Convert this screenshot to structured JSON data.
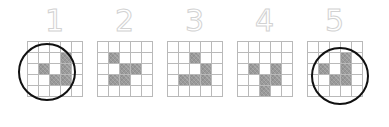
{
  "figure": {
    "type": "pattern-grid-sequence",
    "background_color": "#ffffff",
    "grid_line_color": "#b9b9b9",
    "filled_cell_color": "#9a9a9a",
    "label_outline_color": "#d2d2d2",
    "circle_color": "#111111",
    "grid_rows": 5,
    "grid_cols": 5,
    "panel_count": 5
  },
  "panels": [
    {
      "label": "1",
      "circled": true,
      "filled_cells": [
        [
          2,
          4
        ],
        [
          3,
          2
        ],
        [
          3,
          4
        ],
        [
          4,
          3
        ],
        [
          4,
          4
        ]
      ]
    },
    {
      "label": "2",
      "circled": false,
      "filled_cells": [
        [
          2,
          2
        ],
        [
          3,
          3
        ],
        [
          3,
          4
        ],
        [
          4,
          2
        ],
        [
          4,
          3
        ]
      ]
    },
    {
      "label": "3",
      "circled": false,
      "filled_cells": [
        [
          2,
          3
        ],
        [
          3,
          4
        ],
        [
          4,
          2
        ],
        [
          4,
          3
        ],
        [
          4,
          4
        ]
      ]
    },
    {
      "label": "4",
      "circled": false,
      "filled_cells": [
        [
          3,
          2
        ],
        [
          3,
          4
        ],
        [
          4,
          3
        ],
        [
          4,
          4
        ],
        [
          5,
          3
        ]
      ]
    },
    {
      "label": "5",
      "circled": true,
      "filled_cells": [
        [
          2,
          4
        ],
        [
          3,
          2
        ],
        [
          3,
          4
        ],
        [
          4,
          3
        ],
        [
          4,
          4
        ]
      ]
    }
  ]
}
